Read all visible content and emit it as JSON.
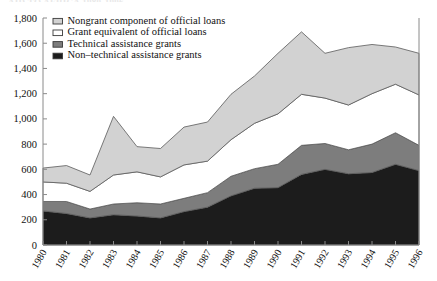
{
  "title_clipped": "AID TO AFRICA 1980-1996",
  "legend": {
    "position": "top-left-inside",
    "items": [
      {
        "label": "Nongrant component of official loans",
        "color": "#d2d2d2",
        "key": "nongrant_component_of_official_loans"
      },
      {
        "label": "Grant equivalent of official loans",
        "color": "#ffffff",
        "key": "grant_equivalent_of_official_loans"
      },
      {
        "label": "Technical assistance grants",
        "color": "#7d7d7d",
        "key": "technical_assistance_grants"
      },
      {
        "label": "Non–technical assistance grants",
        "color": "#1c1c1c",
        "key": "non_technical_assistance_grants"
      }
    ]
  },
  "chart_data": {
    "type": "area",
    "stacked": true,
    "title": "",
    "xlabel": "",
    "ylabel": "",
    "grid": false,
    "ylim": [
      0,
      1800
    ],
    "yticks": [
      0,
      200,
      400,
      600,
      800,
      1000,
      1200,
      1400,
      1600,
      1800
    ],
    "ytick_labels": [
      "0",
      "200",
      "400",
      "600",
      "800",
      "1,000",
      "1,200",
      "1,400",
      "1,600",
      "1,800"
    ],
    "categories": [
      1980,
      1981,
      1982,
      1983,
      1984,
      1985,
      1986,
      1987,
      1988,
      1989,
      1990,
      1991,
      1992,
      1993,
      1994,
      1995,
      1996
    ],
    "xtick_labels": [
      "1980",
      "1981",
      "1982",
      "1983",
      "1984",
      "1985",
      "1986",
      "1987",
      "1988",
      "1989",
      "1990",
      "1991",
      "1992",
      "1993",
      "1994",
      "1995",
      "1996"
    ],
    "series": [
      {
        "name": "Non–technical assistance grants",
        "color": "#1c1c1c",
        "values": [
          270,
          250,
          215,
          240,
          230,
          215,
          265,
          300,
          390,
          450,
          455,
          560,
          600,
          565,
          575,
          640,
          590
        ]
      },
      {
        "name": "Technical assistance grants",
        "color": "#7d7d7d",
        "values": [
          75,
          95,
          70,
          85,
          105,
          110,
          105,
          115,
          155,
          155,
          185,
          230,
          205,
          190,
          225,
          250,
          200
        ]
      },
      {
        "name": "Grant equivalent of official loans",
        "color": "#ffffff",
        "values": [
          155,
          145,
          140,
          230,
          245,
          215,
          265,
          250,
          290,
          360,
          400,
          405,
          360,
          355,
          400,
          385,
          400
        ]
      },
      {
        "name": "Nongrant component of official loans",
        "color": "#d2d2d2",
        "values": [
          110,
          140,
          130,
          465,
          200,
          225,
          300,
          310,
          360,
          375,
          480,
          495,
          355,
          455,
          390,
          295,
          330
        ]
      }
    ],
    "totals": [
      610,
      630,
      555,
      1020,
      780,
      765,
      935,
      975,
      1195,
      1340,
      1520,
      1690,
      1520,
      1565,
      1590,
      1570,
      1520
    ]
  }
}
